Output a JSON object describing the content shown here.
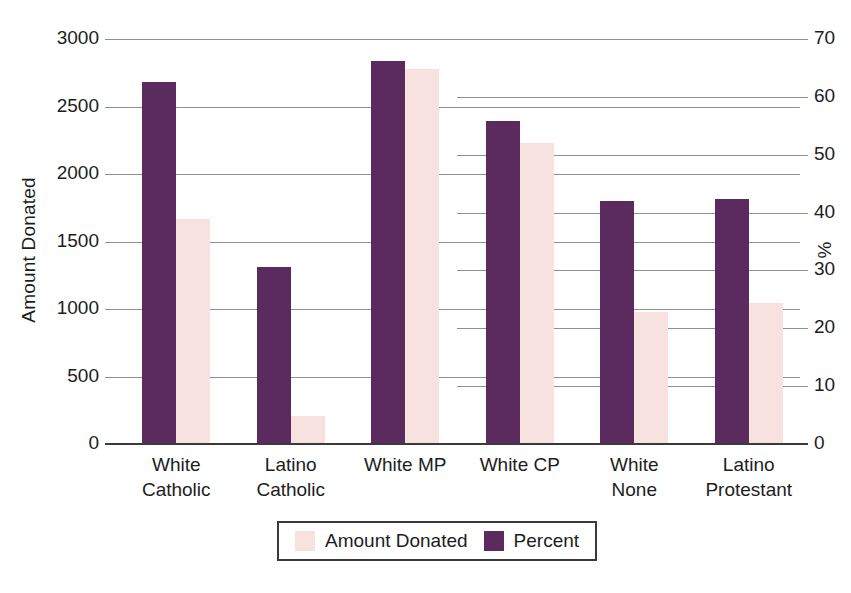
{
  "chart_data": {
    "type": "bar",
    "title": "",
    "xlabel": "",
    "ylabel": "Amount Donated",
    "y2label": "%",
    "categories": [
      "White Catholic",
      "Latino Catholic",
      "White MP",
      "White CP",
      "White None",
      "Latino Protestant"
    ],
    "category_lines": [
      [
        "White",
        "Catholic"
      ],
      [
        "Latino",
        "Catholic"
      ],
      [
        "White MP",
        ""
      ],
      [
        "White CP",
        ""
      ],
      [
        "White",
        "None"
      ],
      [
        "Latino",
        "Protestant"
      ]
    ],
    "series": [
      {
        "name": "Amount Donated",
        "axis": "left",
        "color": "#f7e2e0",
        "values": [
          1670,
          205,
          2780,
          2230,
          980,
          1045
        ]
      },
      {
        "name": "Percent",
        "axis": "right",
        "color": "#5b2a5e",
        "values": [
          62.6,
          30.6,
          66.2,
          55.8,
          42.0,
          42.3
        ]
      }
    ],
    "ylim": [
      0,
      3000
    ],
    "y2lim": [
      0,
      70
    ],
    "yticks": [
      "0",
      "500",
      "1000",
      "1500",
      "2000",
      "2500",
      "3000"
    ],
    "ytick_values": [
      0,
      500,
      1000,
      1500,
      2000,
      2500,
      3000
    ],
    "y2ticks": [
      "0",
      "10",
      "20",
      "30",
      "40",
      "50",
      "60",
      "70"
    ],
    "y2tick_values": [
      0,
      10,
      20,
      30,
      40,
      50,
      60,
      70
    ],
    "grid": true,
    "legend_position": "bottom-center",
    "legend": [
      "Amount Donated",
      "Percent"
    ]
  },
  "legend": {
    "amount_label": "Amount Donated",
    "percent_label": "Percent"
  },
  "axes": {
    "left_title": "Amount Donated",
    "right_title": "%"
  }
}
